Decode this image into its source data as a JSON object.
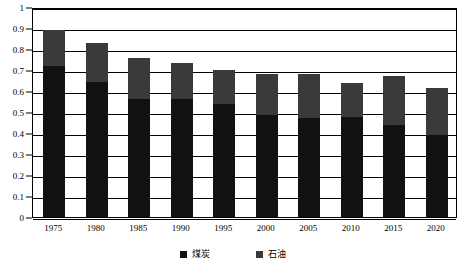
{
  "chart_data": {
    "type": "bar",
    "stacked": true,
    "title": "",
    "subtitle": "",
    "xlabel": "",
    "ylabel": "",
    "categories": [
      "1975",
      "1980",
      "1985",
      "1990",
      "1995",
      "2000",
      "2005",
      "2010",
      "2015",
      "2020"
    ],
    "series": [
      {
        "name": "煤炭",
        "color": "#111111",
        "values": [
          0.72,
          0.645,
          0.56,
          0.56,
          0.54,
          0.485,
          0.47,
          0.475,
          0.44,
          0.39
        ]
      },
      {
        "name": "石油",
        "color": "#3a3a3a",
        "values": [
          0.17,
          0.185,
          0.195,
          0.175,
          0.16,
          0.195,
          0.21,
          0.165,
          0.23,
          0.225
        ]
      }
    ],
    "totals": [
      0.89,
      0.83,
      0.755,
      0.735,
      0.7,
      0.68,
      0.68,
      0.64,
      0.67,
      0.615
    ],
    "ylim": [
      0,
      1
    ],
    "ytick_labels": [
      "0",
      "0.1",
      "0.2",
      "0.3",
      "0.4",
      "0.5",
      "0.6",
      "0.7",
      "0.8",
      "0.9",
      "1"
    ],
    "ytick_values": [
      0,
      0.1,
      0.2,
      0.3,
      0.4,
      0.5,
      0.6,
      0.7,
      0.8,
      0.9,
      1
    ],
    "grid": true,
    "grid_axis": "y",
    "legend_position": "bottom",
    "legend_entries": [
      "煤炭",
      "石油"
    ]
  }
}
